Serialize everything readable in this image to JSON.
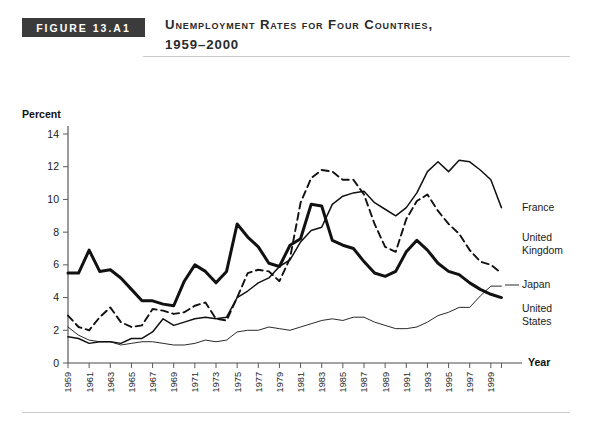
{
  "figure": {
    "badge_label": "FIGURE 13.A1",
    "title_line1": "Unemployment Rates for Four Countries,",
    "title_line2": "1959–2000"
  },
  "chart_data": {
    "type": "line",
    "title": "Unemployment Rates for Four Countries, 1959–2000",
    "xlabel": "Year",
    "ylabel": "Percent",
    "ylim": [
      0,
      14
    ],
    "xlim": [
      1959,
      2001
    ],
    "ytick_labels": [
      "0",
      "2",
      "4",
      "6",
      "8",
      "10",
      "12",
      "14"
    ],
    "ytick_values": [
      0,
      2,
      4,
      6,
      8,
      10,
      12,
      14
    ],
    "grid": false,
    "legend_position": "right-inline-labels",
    "xtick_labels": [
      "1959",
      "1961",
      "1963",
      "1965",
      "1967",
      "1969",
      "1971",
      "1973",
      "1975",
      "1977",
      "1979",
      "1981",
      "1983",
      "1985",
      "1987",
      "1989",
      "1991",
      "1993",
      "1995",
      "1997",
      "1999"
    ],
    "xtick_values": [
      1959,
      1961,
      1963,
      1965,
      1967,
      1969,
      1971,
      1973,
      1975,
      1977,
      1979,
      1981,
      1983,
      1985,
      1987,
      1989,
      1991,
      1993,
      1995,
      1997,
      1999
    ],
    "x": [
      1959,
      1960,
      1961,
      1962,
      1963,
      1964,
      1965,
      1966,
      1967,
      1968,
      1969,
      1970,
      1971,
      1972,
      1973,
      1974,
      1975,
      1976,
      1977,
      1978,
      1979,
      1980,
      1981,
      1982,
      1983,
      1984,
      1985,
      1986,
      1987,
      1988,
      1989,
      1990,
      1991,
      1992,
      1993,
      1994,
      1995,
      1996,
      1997,
      1998,
      1999,
      2000
    ],
    "series": [
      {
        "name": "United States",
        "style": "thick-solid",
        "label_line1": "United",
        "label_line2": "States",
        "values": [
          5.5,
          5.5,
          6.9,
          5.6,
          5.7,
          5.2,
          4.5,
          3.8,
          3.8,
          3.6,
          3.5,
          5.0,
          6.0,
          5.6,
          4.9,
          5.6,
          8.5,
          7.7,
          7.1,
          6.1,
          5.9,
          7.2,
          7.6,
          9.7,
          9.6,
          7.5,
          7.2,
          7.0,
          6.2,
          5.5,
          5.3,
          5.6,
          6.8,
          7.5,
          6.9,
          6.1,
          5.6,
          5.4,
          4.9,
          4.5,
          4.2,
          4.0
        ]
      },
      {
        "name": "France",
        "style": "thin-solid",
        "label_line1": "France",
        "label_line2": "",
        "values": [
          1.6,
          1.5,
          1.2,
          1.3,
          1.3,
          1.2,
          1.5,
          1.5,
          1.9,
          2.7,
          2.3,
          2.5,
          2.7,
          2.8,
          2.7,
          2.8,
          4.0,
          4.4,
          4.9,
          5.2,
          5.9,
          6.3,
          7.4,
          8.1,
          8.3,
          9.7,
          10.2,
          10.4,
          10.5,
          9.8,
          9.4,
          9.0,
          9.5,
          10.4,
          11.7,
          12.3,
          11.7,
          12.4,
          12.3,
          11.8,
          11.2,
          9.5
        ]
      },
      {
        "name": "United Kingdom",
        "style": "dashed",
        "label_line1": "United",
        "label_line2": "Kingdom",
        "values": [
          2.9,
          2.2,
          2.0,
          2.8,
          3.4,
          2.5,
          2.2,
          2.3,
          3.3,
          3.2,
          3.0,
          3.1,
          3.5,
          3.7,
          2.7,
          2.6,
          4.0,
          5.5,
          5.7,
          5.6,
          5.0,
          6.4,
          9.8,
          11.3,
          11.8,
          11.7,
          11.2,
          11.2,
          10.3,
          8.5,
          7.1,
          6.8,
          8.8,
          9.9,
          10.3,
          9.3,
          8.5,
          7.9,
          6.9,
          6.2,
          6.0,
          5.5
        ]
      },
      {
        "name": "Japan",
        "style": "hairline-solid",
        "label_line1": "Japan",
        "label_line2": "",
        "values": [
          2.2,
          1.7,
          1.4,
          1.3,
          1.3,
          1.1,
          1.2,
          1.3,
          1.3,
          1.2,
          1.1,
          1.1,
          1.2,
          1.4,
          1.3,
          1.4,
          1.9,
          2.0,
          2.0,
          2.2,
          2.1,
          2.0,
          2.2,
          2.4,
          2.6,
          2.7,
          2.6,
          2.8,
          2.8,
          2.5,
          2.3,
          2.1,
          2.1,
          2.2,
          2.5,
          2.9,
          3.1,
          3.4,
          3.4,
          4.1,
          4.7,
          4.7
        ]
      }
    ]
  }
}
